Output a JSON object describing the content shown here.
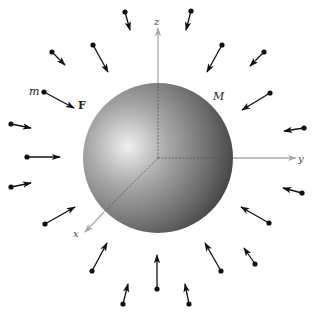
{
  "diagram": {
    "colors": {
      "background": "#ffffff",
      "arrow": "#111111",
      "axis": "#aaaaaa",
      "axis_hidden": "#555555",
      "sphere_highlight": "#f2f2f2",
      "sphere_mid": "#8c8c8c",
      "sphere_dark": "#3a3a3a"
    },
    "sphere": {
      "label": "M",
      "cx": 158,
      "cy": 158,
      "r": 75
    },
    "axes": {
      "origin": [
        158,
        158
      ],
      "z": {
        "label": "z",
        "tip": [
          158,
          28
        ]
      },
      "y": {
        "label": "y",
        "tip": [
          296,
          158
        ]
      },
      "x": {
        "label": "x",
        "tip": [
          85,
          232
        ]
      }
    },
    "test_mass": {
      "label": "m",
      "force_label": "F"
    },
    "arrows": [
      {
        "from": [
          125,
          12
        ],
        "to": [
          130,
          30
        ]
      },
      {
        "from": [
          93,
          45
        ],
        "to": [
          108,
          72
        ]
      },
      {
        "from": [
          52,
          52
        ],
        "to": [
          65,
          65
        ]
      },
      {
        "from": [
          44,
          92
        ],
        "to": [
          74,
          108
        ]
      },
      {
        "from": [
          11,
          124
        ],
        "to": [
          31,
          128
        ]
      },
      {
        "from": [
          27,
          157
        ],
        "to": [
          60,
          157
        ]
      },
      {
        "from": [
          11,
          187
        ],
        "to": [
          31,
          183
        ]
      },
      {
        "from": [
          45,
          224
        ],
        "to": [
          75,
          207
        ]
      },
      {
        "from": [
          92,
          271
        ],
        "to": [
          107,
          243
        ]
      },
      {
        "from": [
          123,
          304
        ],
        "to": [
          128,
          284
        ]
      },
      {
        "from": [
          157,
          289
        ],
        "to": [
          157,
          255
        ]
      },
      {
        "from": [
          189,
          304
        ],
        "to": [
          185,
          284
        ]
      },
      {
        "from": [
          221,
          271
        ],
        "to": [
          205,
          243
        ]
      },
      {
        "from": [
          255,
          264
        ],
        "to": [
          244,
          248
        ]
      },
      {
        "from": [
          269,
          223
        ],
        "to": [
          241,
          207
        ]
      },
      {
        "from": [
          302,
          193
        ],
        "to": [
          283,
          188
        ]
      },
      {
        "from": [
          304,
          128
        ],
        "to": [
          284,
          131
        ]
      },
      {
        "from": [
          270,
          93
        ],
        "to": [
          242,
          110
        ]
      },
      {
        "from": [
          264,
          52
        ],
        "to": [
          250,
          66
        ]
      },
      {
        "from": [
          222,
          45
        ],
        "to": [
          207,
          72
        ]
      },
      {
        "from": [
          191,
          11
        ],
        "to": [
          186,
          30
        ]
      }
    ]
  }
}
